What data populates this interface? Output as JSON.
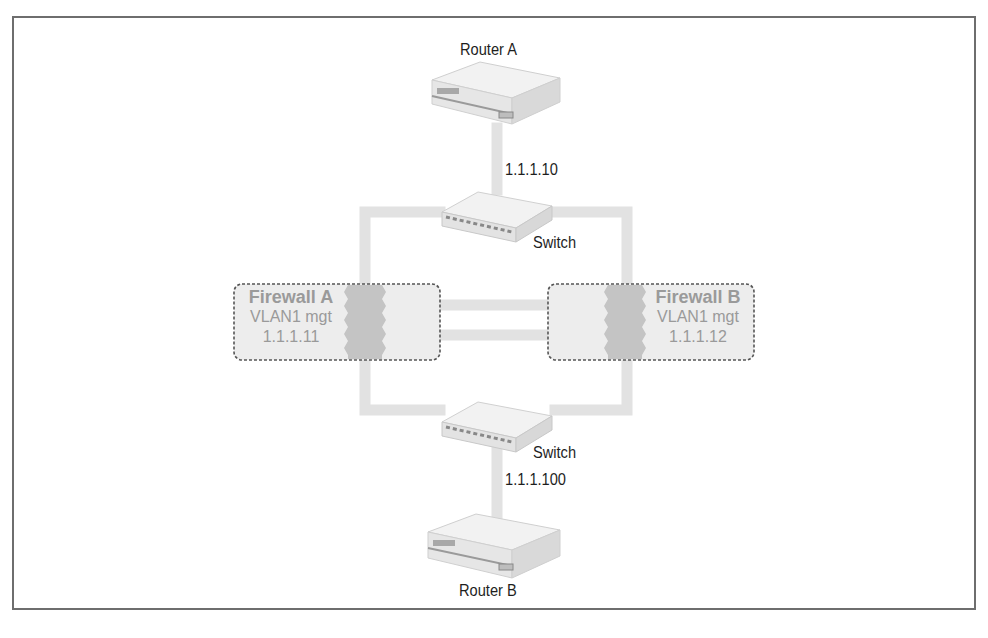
{
  "diagram": {
    "type": "network-topology",
    "nodes": {
      "router_a": {
        "label": "Router A",
        "ip": "1.1.1.10"
      },
      "switch_top": {
        "label": "Switch"
      },
      "firewall_a": {
        "title": "Firewall A",
        "vlan": "VLAN1 mgt",
        "ip": "1.1.1.11"
      },
      "firewall_b": {
        "title": "Firewall B",
        "vlan": "VLAN1 mgt",
        "ip": "1.1.1.12"
      },
      "switch_bottom": {
        "label": "Switch",
        "ip": "1.1.1.100"
      },
      "router_b": {
        "label": "Router B"
      }
    },
    "edges": [
      [
        "router_a",
        "switch_top"
      ],
      [
        "switch_top",
        "firewall_a"
      ],
      [
        "switch_top",
        "firewall_b"
      ],
      [
        "firewall_a",
        "firewall_b"
      ],
      [
        "firewall_a",
        "firewall_b"
      ],
      [
        "firewall_a",
        "switch_bottom"
      ],
      [
        "firewall_b",
        "switch_bottom"
      ],
      [
        "switch_bottom",
        "router_b"
      ]
    ],
    "colors": {
      "link": "#e2e2e2",
      "firewall_fill": "#ededed",
      "firewall_border": "#555555",
      "firewall_zigzag": "#c4c4c4",
      "device_body": "#eeeeee",
      "frame_border": "#6e6e6e"
    }
  }
}
